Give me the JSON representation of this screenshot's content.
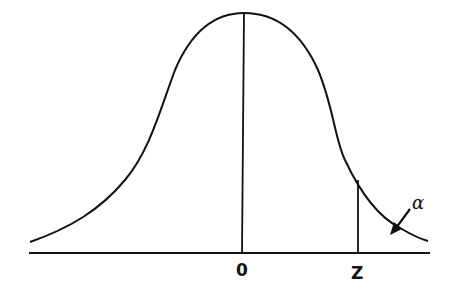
{
  "diagram": {
    "title": "",
    "type": "normal-distribution-curve",
    "labels": {
      "mean": "0",
      "critical": "Z",
      "tail_area": "α"
    },
    "stroke_color": "#111111",
    "background": "#ffffff"
  }
}
